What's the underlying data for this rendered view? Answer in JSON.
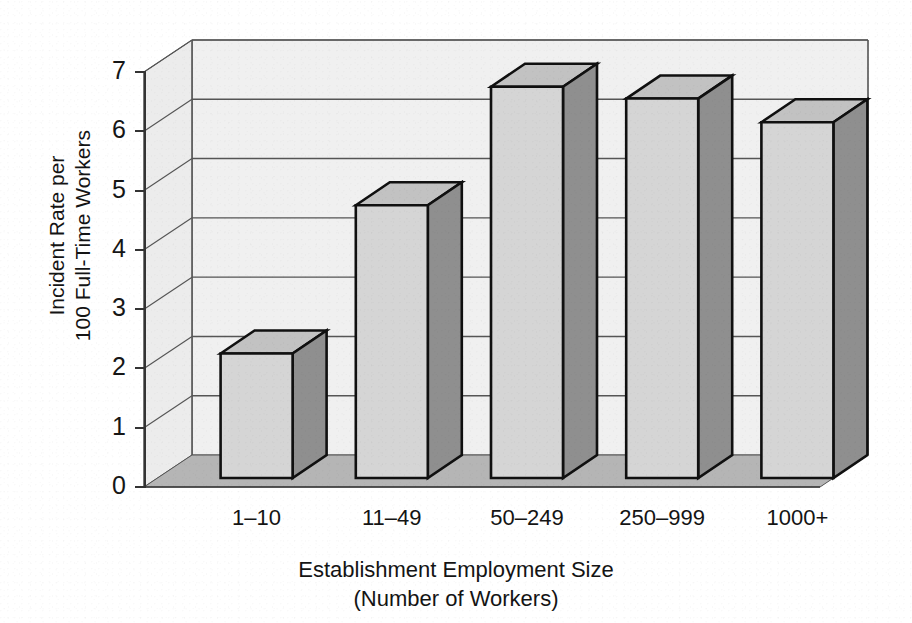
{
  "chart_data": {
    "type": "bar",
    "title": "",
    "subtitle": "",
    "categories": [
      "1–10",
      "11–49",
      "50–249",
      "250–999",
      "1000+"
    ],
    "values": [
      2.1,
      4.6,
      6.6,
      6.4,
      6.0
    ],
    "series": [
      {
        "name": "Incident Rate per 100 Full-Time Workers",
        "values": [
          2.1,
          4.6,
          6.6,
          6.4,
          6.0
        ]
      }
    ],
    "xlabel": "Establishment Employment Size (Number of Workers)",
    "xlabel_line1": "Establishment Employment Size",
    "xlabel_line2": "(Number of Workers)",
    "ylabel": "Incident Rate per 100 Full-Time Workers",
    "ylabel_line1": "Incident Rate per",
    "ylabel_line2": "100 Full-Time Workers",
    "ylim": [
      0,
      7
    ],
    "ytick_labels": [
      "0",
      "1",
      "2",
      "3",
      "4",
      "5",
      "6",
      "7"
    ],
    "ytick_values": [
      0,
      1,
      2,
      3,
      4,
      5,
      6,
      7
    ],
    "grid": true,
    "grid_axis": "y",
    "legend": false,
    "legend_position": "none",
    "style": "3d-column",
    "colors": {
      "bar_front": "#d5d5d5",
      "bar_side": "#8f8f8f",
      "bar_top": "#c2c2c2",
      "bar_outline": "#101010",
      "wall_back": "#f0f0f0",
      "wall_left": "#ececec",
      "floor": "#b5b5b5",
      "gridline": "#555555",
      "axis": "#333333",
      "text": "#141414",
      "background": "#ffffff"
    }
  }
}
